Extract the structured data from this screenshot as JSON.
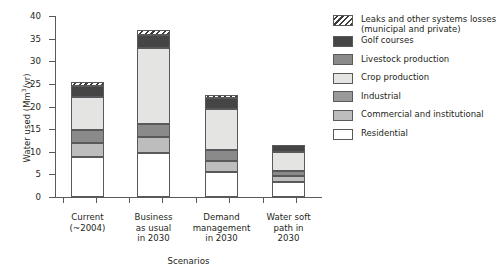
{
  "chart_data": {
    "type": "bar",
    "subtype": "stacked-bar",
    "title": "",
    "xlabel": "Scenarios",
    "ylabel": "Water used (Mm3/yr)",
    "ylabel_parts": {
      "prefix": "Water used (Mm",
      "sup": "3",
      "suffix": "/yr)"
    },
    "ylim": [
      0,
      40
    ],
    "yticks": [
      0,
      5,
      10,
      15,
      20,
      25,
      30,
      35,
      40
    ],
    "ytick_labels": [
      "0",
      "5",
      "10",
      "15",
      "20",
      "25",
      "30",
      "35",
      "40"
    ],
    "grid": false,
    "legend_position": "right",
    "categories": [
      "Current (~2004)",
      "Business as usual in 2030",
      "Demand management in 2030",
      "Water soft path in 2030"
    ],
    "category_lines": [
      [
        "Current",
        "(~2004)"
      ],
      [
        "Business",
        "as usual",
        "in 2030"
      ],
      [
        "Demand",
        "management",
        "in 2030"
      ],
      [
        "Water soft",
        "path in",
        "2030"
      ]
    ],
    "series": [
      {
        "name": "Residential",
        "key": "residential",
        "color": "#ffffff",
        "values": [
          8.8,
          9.7,
          5.6,
          3.4
        ]
      },
      {
        "name": "Commercial and institutional",
        "key": "commercial",
        "color": "#bdbdbd",
        "values": [
          3.2,
          3.6,
          2.4,
          1.3
        ]
      },
      {
        "name": "Industrial",
        "key": "industrial",
        "color": "#9a9a9a",
        "values": [
          2.9,
          3.3,
          1.9,
          0.9
        ]
      },
      {
        "name": "Crop production",
        "key": "crop",
        "color": "#e4e4e2",
        "values": [
          7.1,
          19.2,
          8.2,
          5.0
        ]
      },
      {
        "name": "Livestock production",
        "key": "livestock",
        "color": "#8a8a8a",
        "values": [
          0.0,
          0.0,
          0.0,
          0.0
        ]
      },
      {
        "name": "Golf courses",
        "key": "golf",
        "color": "#454545",
        "values": [
          2.6,
          2.0,
          2.0,
          0.9
        ]
      },
      {
        "name": "Leaks and other systems losses (municipal and private)",
        "key": "leaks",
        "color": "hatched",
        "values": [
          0.9,
          0.9,
          0.9,
          0.0
        ]
      }
    ],
    "totals": [
      25.5,
      37.0,
      22.5,
      11.5
    ],
    "stack_order_bottom_to_top": [
      "residential",
      "commercial",
      "industrial",
      "livestock",
      "crop",
      "golf",
      "leaks"
    ],
    "bars": [
      {
        "label": "Current (~2004)",
        "total": 25.5,
        "segments": [
          {
            "key": "residential",
            "name": "Residential",
            "from": 0.0,
            "to": 8.8
          },
          {
            "key": "commercial",
            "name": "Commercial and institutional",
            "from": 8.8,
            "to": 12.0
          },
          {
            "key": "livestock",
            "name": "Livestock production",
            "from": 12.0,
            "to": 14.9
          },
          {
            "key": "crop",
            "name": "Crop production",
            "from": 14.9,
            "to": 22.0
          },
          {
            "key": "golf",
            "name": "Golf courses",
            "from": 22.0,
            "to": 24.6
          },
          {
            "key": "leaks",
            "name": "Leaks and other systems losses",
            "from": 24.6,
            "to": 25.5
          }
        ]
      },
      {
        "label": "Business as usual in 2030",
        "total": 37.0,
        "segments": [
          {
            "key": "residential",
            "name": "Residential",
            "from": 0.0,
            "to": 9.7
          },
          {
            "key": "commercial",
            "name": "Commercial and institutional",
            "from": 9.7,
            "to": 13.3
          },
          {
            "key": "livestock",
            "name": "Livestock production",
            "from": 13.3,
            "to": 16.1
          },
          {
            "key": "crop",
            "name": "Crop production",
            "from": 16.1,
            "to": 33.0
          },
          {
            "key": "golf",
            "name": "Golf courses",
            "from": 33.0,
            "to": 35.9
          },
          {
            "key": "leaks",
            "name": "Leaks and other systems losses",
            "from": 35.9,
            "to": 37.0
          }
        ]
      },
      {
        "label": "Demand management in 2030",
        "total": 22.5,
        "segments": [
          {
            "key": "residential",
            "name": "Residential",
            "from": 0.0,
            "to": 5.6
          },
          {
            "key": "commercial",
            "name": "Commercial and institutional",
            "from": 5.6,
            "to": 8.0
          },
          {
            "key": "livestock",
            "name": "Livestock production",
            "from": 8.0,
            "to": 10.3
          },
          {
            "key": "crop",
            "name": "Crop production",
            "from": 10.3,
            "to": 19.4
          },
          {
            "key": "golf",
            "name": "Golf courses",
            "from": 19.4,
            "to": 21.9
          },
          {
            "key": "leaks",
            "name": "Leaks and other systems losses",
            "from": 21.9,
            "to": 22.5
          }
        ]
      },
      {
        "label": "Water soft path in 2030",
        "total": 11.5,
        "segments": [
          {
            "key": "residential",
            "name": "Residential",
            "from": 0.0,
            "to": 3.4
          },
          {
            "key": "commercial",
            "name": "Commercial and institutional",
            "from": 3.4,
            "to": 4.7
          },
          {
            "key": "livestock",
            "name": "Livestock production",
            "from": 4.7,
            "to": 5.8
          },
          {
            "key": "crop",
            "name": "Crop production",
            "from": 5.8,
            "to": 10.0
          },
          {
            "key": "golf",
            "name": "Golf courses",
            "from": 10.0,
            "to": 11.5
          }
        ]
      }
    ],
    "legend": [
      {
        "key": "leaks",
        "lines": [
          "Leaks and other systems losses",
          "(municipal and private)"
        ]
      },
      {
        "key": "golf",
        "lines": [
          "Golf courses"
        ]
      },
      {
        "key": "livestock",
        "lines": [
          "Livestock production"
        ]
      },
      {
        "key": "crop",
        "lines": [
          "Crop production"
        ]
      },
      {
        "key": "industrial",
        "lines": [
          "Industrial"
        ]
      },
      {
        "key": "commercial",
        "lines": [
          "Commercial and institutional"
        ]
      },
      {
        "key": "residential",
        "lines": [
          "Residential"
        ]
      }
    ]
  }
}
